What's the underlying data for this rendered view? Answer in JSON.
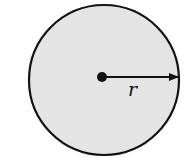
{
  "diagram": {
    "type": "circle-radius",
    "circle": {
      "cx": 104,
      "cy": 80,
      "r": 75,
      "fill": "#e4e4e4",
      "stroke": "#111111"
    },
    "center_dot": {
      "cx": 102,
      "cy": 77,
      "r": 5
    },
    "radius_arrow": {
      "x1": 102,
      "y1": 77,
      "x2": 179,
      "y2": 77
    },
    "label": "r"
  }
}
